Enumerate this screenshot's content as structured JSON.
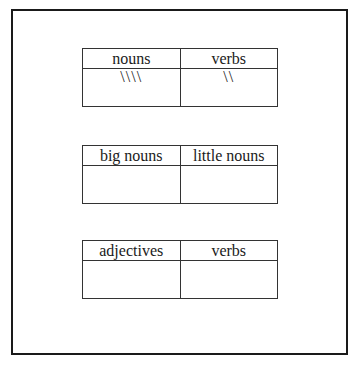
{
  "tables": [
    {
      "headers": [
        "nouns",
        "verbs"
      ],
      "cells": [
        "\\\\\\\\",
        "\\\\"
      ]
    },
    {
      "headers": [
        "big nouns",
        "little nouns"
      ],
      "cells": [
        "",
        ""
      ]
    },
    {
      "headers": [
        "adjectives",
        "verbs"
      ],
      "cells": [
        "",
        ""
      ]
    }
  ]
}
